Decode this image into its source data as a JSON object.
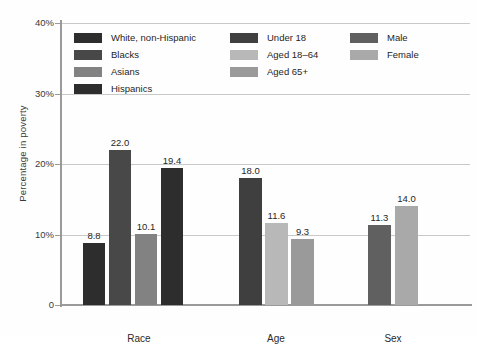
{
  "chart_data": {
    "type": "bar",
    "title": "",
    "subtitle": "",
    "xlabel": "",
    "ylabel": "Percentage in poverty",
    "ylim": [
      0,
      40
    ],
    "yticks": [
      {
        "value": 0,
        "label": "0"
      },
      {
        "value": 10,
        "label": "10%"
      },
      {
        "value": 20,
        "label": "20%"
      },
      {
        "value": 30,
        "label": "30%"
      },
      {
        "value": 40,
        "label": "40%"
      }
    ],
    "grid": true,
    "legend_position": "inside-top",
    "groups": [
      {
        "name": "Race",
        "bars": [
          {
            "label": "White, non-Hispanic",
            "value": 8.8,
            "value_label": "8.8",
            "color": "#2d2d2d"
          },
          {
            "label": "Blacks",
            "value": 22.0,
            "value_label": "22.0",
            "color": "#484848"
          },
          {
            "label": "Asians",
            "value": 10.1,
            "value_label": "10.1",
            "color": "#828282"
          },
          {
            "label": "Hispanics",
            "value": 19.4,
            "value_label": "19.4",
            "color": "#2d2d2d"
          }
        ]
      },
      {
        "name": "Age",
        "bars": [
          {
            "label": "Under 18",
            "value": 18.0,
            "value_label": "18.0",
            "color": "#3f3f3f"
          },
          {
            "label": "Aged 18–64",
            "value": 11.6,
            "value_label": "11.6",
            "color": "#b8b8b8"
          },
          {
            "label": "Aged 65+",
            "value": 9.3,
            "value_label": "9.3",
            "color": "#9a9a9a"
          }
        ]
      },
      {
        "name": "Sex",
        "bars": [
          {
            "label": "Male",
            "value": 11.3,
            "value_label": "11.3",
            "color": "#606060"
          },
          {
            "label": "Female",
            "value": 14.0,
            "value_label": "14.0",
            "color": "#a9a9a9"
          }
        ]
      }
    ],
    "legend_columns": [
      {
        "entries": [
          {
            "label": "White, non-Hispanic",
            "color": "#2d2d2d"
          },
          {
            "label": "Blacks",
            "color": "#484848"
          },
          {
            "label": "Asians",
            "color": "#828282"
          },
          {
            "label": "Hispanics",
            "color": "#2d2d2d"
          }
        ]
      },
      {
        "entries": [
          {
            "label": "Under 18",
            "color": "#3f3f3f"
          },
          {
            "label": "Aged 18–64",
            "color": "#b8b8b8"
          },
          {
            "label": "Aged 65+",
            "color": "#9a9a9a"
          }
        ]
      },
      {
        "entries": [
          {
            "label": "Male",
            "color": "#606060"
          },
          {
            "label": "Female",
            "color": "#a9a9a9"
          }
        ]
      }
    ]
  },
  "colors": {
    "axis": "#9a9a9a",
    "grid": "#c9c9c9",
    "text": "#262626",
    "background": "#fefefe"
  }
}
